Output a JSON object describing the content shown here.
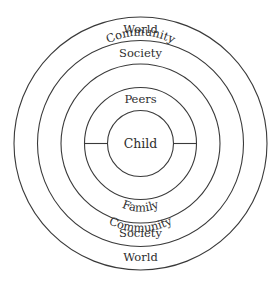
{
  "diagram": {
    "type": "concentric-circles",
    "center": {
      "x": 140.5,
      "y": 143.5
    },
    "stroke_color": "#3a3a3a",
    "text_color": "#2e2e2e",
    "rings": [
      {
        "name": "child",
        "radius": 33
      },
      {
        "name": "peers-family",
        "radius": 56
      },
      {
        "name": "community",
        "radius": 79.5
      },
      {
        "name": "society",
        "radius": 103
      },
      {
        "name": "world",
        "radius": 126.5
      }
    ],
    "labels": {
      "center": "Child",
      "top": {
        "ring2": "Peers",
        "ring3": "Community",
        "ring4": "Society",
        "ring5": "World"
      },
      "bottom": {
        "ring2": "Family",
        "ring3": "Community",
        "ring4": "Society",
        "ring5": "World"
      }
    }
  }
}
